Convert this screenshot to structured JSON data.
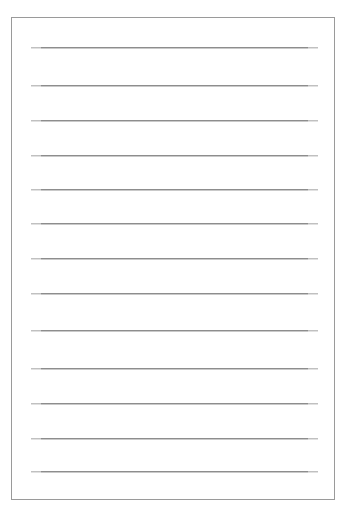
{
  "document": {
    "kind": "lined-paper-sheet",
    "title": "Lined Paper",
    "orientation": "portrait",
    "canvas": {
      "width": 346,
      "height": 517
    },
    "background_color": "#ffffff"
  },
  "page_border": {
    "x": 11,
    "y": 17,
    "width": 324,
    "height": 483,
    "color": "#9a9a9a",
    "thickness": 1
  },
  "ruled_lines": {
    "count": 13,
    "color": "#8d8d8d",
    "shadow_color": "#c9c9c9",
    "thickness": 1,
    "left": 20,
    "right": 307,
    "spacing": 35,
    "positions": [
      30,
      68,
      103,
      138,
      172,
      206,
      241,
      276,
      313,
      351,
      386,
      421,
      454
    ]
  }
}
